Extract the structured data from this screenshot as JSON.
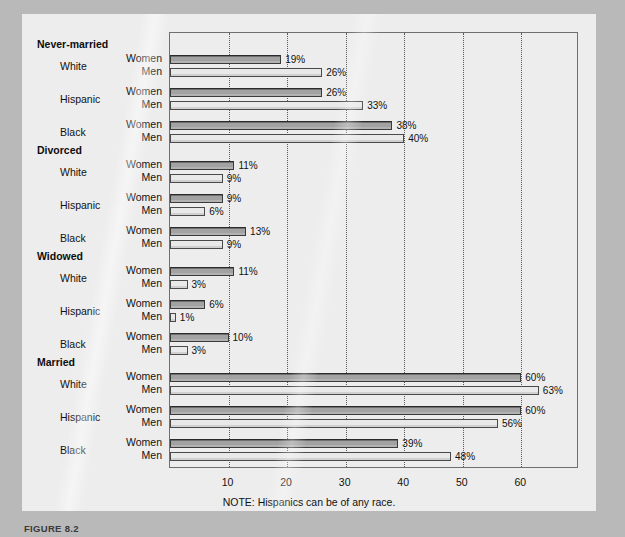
{
  "note": "NOTE: Hispanics can be of any race.",
  "figure_caption": "FIGURE 8.2",
  "axis": {
    "ticks": [
      10,
      20,
      30,
      40,
      50,
      60
    ],
    "tick_labels": [
      "10",
      "20",
      "30",
      "40",
      "50",
      "60"
    ],
    "min": 0,
    "max": 70
  },
  "series_labels": {
    "women": "Women",
    "men": "Men"
  },
  "chart_data": {
    "type": "bar",
    "orientation": "horizontal",
    "title": "",
    "xlabel": "",
    "ylabel": "",
    "xlim": [
      0,
      70
    ],
    "grid": true,
    "legend": "none",
    "note": "NOTE: Hispanics can be of any race.",
    "categories": [
      "Never-married / White",
      "Never-married / Hispanic",
      "Never-married / Black",
      "Divorced / White",
      "Divorced / Hispanic",
      "Divorced / Black",
      "Widowed / White",
      "Widowed / Hispanic",
      "Widowed / Black",
      "Married / White",
      "Married / Hispanic",
      "Married / Black"
    ],
    "series": [
      {
        "name": "Women",
        "values": [
          19,
          26,
          38,
          11,
          9,
          13,
          11,
          6,
          10,
          60,
          60,
          39
        ]
      },
      {
        "name": "Men",
        "values": [
          26,
          33,
          40,
          9,
          6,
          9,
          3,
          1,
          3,
          63,
          56,
          48
        ]
      }
    ],
    "value_labels": {
      "Women": [
        "19%",
        "26%",
        "38%",
        "11%",
        "9%",
        "13%",
        "11%",
        "6%",
        "10%",
        "60%",
        "60%",
        "39%"
      ],
      "Men": [
        "26%",
        "33%",
        "40%",
        "9%",
        "6%",
        "9%",
        "3%",
        "1%",
        "3%",
        "63%",
        "56%",
        "48%"
      ]
    },
    "groups": [
      {
        "title": "Never-married",
        "rows": [
          {
            "race": "White",
            "women": 19,
            "men": 26,
            "women_label": "19%",
            "men_label": "26%"
          },
          {
            "race": "Hispanic",
            "women": 26,
            "men": 33,
            "women_label": "26%",
            "men_label": "33%"
          },
          {
            "race": "Black",
            "women": 38,
            "men": 40,
            "women_label": "38%",
            "men_label": "40%"
          }
        ]
      },
      {
        "title": "Divorced",
        "rows": [
          {
            "race": "White",
            "women": 11,
            "men": 9,
            "women_label": "11%",
            "men_label": "9%"
          },
          {
            "race": "Hispanic",
            "women": 9,
            "men": 6,
            "women_label": "9%",
            "men_label": "6%"
          },
          {
            "race": "Black",
            "women": 13,
            "men": 9,
            "women_label": "13%",
            "men_label": "9%"
          }
        ]
      },
      {
        "title": "Widowed",
        "rows": [
          {
            "race": "White",
            "women": 11,
            "men": 3,
            "women_label": "11%",
            "men_label": "3%"
          },
          {
            "race": "Hispanic",
            "women": 6,
            "men": 1,
            "women_label": "6%",
            "men_label": "1%"
          },
          {
            "race": "Black",
            "women": 10,
            "men": 3,
            "women_label": "10%",
            "men_label": "3%"
          }
        ]
      },
      {
        "title": "Married",
        "rows": [
          {
            "race": "White",
            "women": 60,
            "men": 63,
            "women_label": "60%",
            "men_label": "63%"
          },
          {
            "race": "Hispanic",
            "women": 60,
            "men": 56,
            "women_label": "60%",
            "men_label": "56%"
          },
          {
            "race": "Black",
            "women": 39,
            "men": 48,
            "women_label": "39%",
            "men_label": "48%"
          }
        ]
      }
    ]
  },
  "colors": {
    "women_bar": "#a2a2a2",
    "men_bar": "#e9e9e9",
    "page": "#ededed",
    "frame": "#6f6f6f",
    "outer": "#b9b9b9"
  }
}
